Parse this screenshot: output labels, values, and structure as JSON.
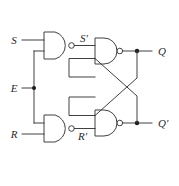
{
  "diagram": {
    "type": "logic-circuit",
    "background_color": "#ffffff",
    "wire_color": "#404040",
    "label_color": "#2a2a2a",
    "junction_color": "#1a1a1a"
  },
  "labels": {
    "input_s": "S",
    "input_e": "E",
    "input_r": "R",
    "node_s_prime": "S'",
    "node_r_prime": "R'",
    "output_q": "Q",
    "output_q_prime": "Q'"
  },
  "gates": [
    {
      "id": "nand-s",
      "type": "NAND",
      "inputs": [
        "S",
        "E"
      ],
      "output": "S'"
    },
    {
      "id": "nand-r",
      "type": "NAND",
      "inputs": [
        "E",
        "R"
      ],
      "output": "R'"
    },
    {
      "id": "nand-q",
      "type": "NAND",
      "inputs": [
        "S'",
        "Q'"
      ],
      "output": "Q"
    },
    {
      "id": "nand-qprime",
      "type": "NAND",
      "inputs": [
        "Q",
        "R'"
      ],
      "output": "Q'"
    }
  ],
  "junctions": [
    {
      "id": "junction-e",
      "label": "E"
    },
    {
      "id": "junction-q",
      "label": "Q"
    },
    {
      "id": "junction-qprime",
      "label": "Q'"
    }
  ]
}
